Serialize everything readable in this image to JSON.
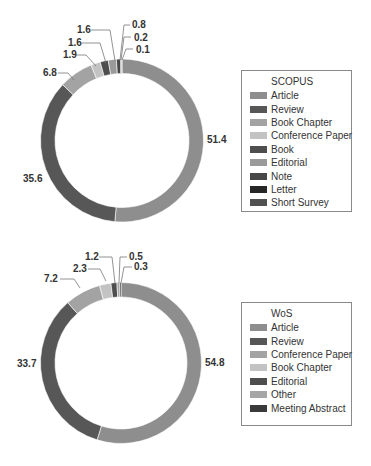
{
  "colors": {
    "article": "#8e8e8e",
    "review": "#575757",
    "book_chapter": "#a3a3a3",
    "conference_paper": "#c3c3c3",
    "book": "#4e4e4e",
    "editorial": "#9a9a9a",
    "note": "#474747",
    "letter": "#262626",
    "short_survey": "#515151",
    "other": "#a6a6a6",
    "meeting_abstract": "#3a3a3a"
  },
  "chart_data": [
    {
      "type": "pie",
      "variant": "donut",
      "title": "SCOPUS",
      "legend_title": "SCOPUS",
      "legend_position": "right",
      "unit": "%",
      "categories": [
        "Article",
        "Review",
        "Book Chapter",
        "Conference Paper",
        "Book",
        "Editorial",
        "Note",
        "Letter",
        "Short Survey"
      ],
      "values": [
        51.4,
        35.6,
        6.8,
        1.9,
        1.6,
        1.6,
        0.8,
        0.2,
        0.1
      ],
      "value_labels": [
        "51.4",
        "35.6",
        "6.8",
        "1.9",
        "1.6",
        "1.6",
        "0.8",
        "0.2",
        "0.1"
      ],
      "start_angle": "12 o'clock",
      "direction": "clockwise"
    },
    {
      "type": "pie",
      "variant": "donut",
      "title": "WoS",
      "legend_title": "WoS",
      "legend_position": "right",
      "unit": "%",
      "categories": [
        "Article",
        "Review",
        "Conference Paper",
        "Book Chapter",
        "Editorial",
        "Other",
        "Meeting Abstract"
      ],
      "values": [
        54.8,
        33.7,
        7.2,
        2.3,
        1.2,
        0.5,
        0.3
      ],
      "value_labels": [
        "54.8",
        "33.7",
        "7.2",
        "2.3",
        "1.2",
        "0.5",
        "0.3"
      ],
      "start_angle": "12 o'clock",
      "direction": "clockwise"
    }
  ],
  "scopus": {
    "legend": {
      "title": "SCOPUS",
      "items": [
        {
          "label": "Article",
          "color": "#8e8e8e"
        },
        {
          "label": "Review",
          "color": "#575757"
        },
        {
          "label": "Book Chapter",
          "color": "#a3a3a3"
        },
        {
          "label": "Conference Paper",
          "color": "#c3c3c3"
        },
        {
          "label": "Book",
          "color": "#4e4e4e"
        },
        {
          "label": "Editorial",
          "color": "#9a9a9a"
        },
        {
          "label": "Note",
          "color": "#474747"
        },
        {
          "label": "Letter",
          "color": "#262626"
        },
        {
          "label": "Short Survey",
          "color": "#515151"
        }
      ]
    },
    "labels": [
      "51.4",
      "35.6",
      "6.8",
      "1.9",
      "1.6",
      "1.6",
      "0.8",
      "0.2",
      "0.1"
    ]
  },
  "wos": {
    "legend": {
      "title": "WoS",
      "items": [
        {
          "label": "Article",
          "color": "#8e8e8e"
        },
        {
          "label": "Review",
          "color": "#575757"
        },
        {
          "label": "Conference Paper",
          "color": "#a3a3a3"
        },
        {
          "label": "Book Chapter",
          "color": "#c3c3c3"
        },
        {
          "label": "Editorial",
          "color": "#4e4e4e"
        },
        {
          "label": "Other",
          "color": "#a6a6a6"
        },
        {
          "label": "Meeting Abstract",
          "color": "#3a3a3a"
        }
      ]
    },
    "labels": [
      "54.8",
      "33.7",
      "7.2",
      "2.3",
      "1.2",
      "0.5",
      "0.3"
    ]
  }
}
